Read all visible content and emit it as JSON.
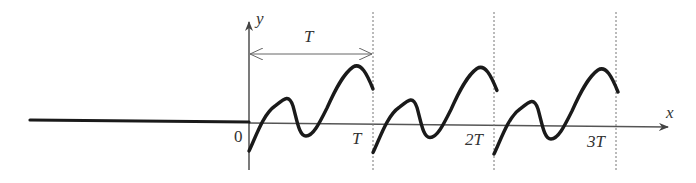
{
  "diagram": {
    "colors": {
      "curve": "#1a1a1a",
      "axis": "#555555",
      "dashed": "#777777",
      "text": "#333333"
    },
    "axes": {
      "x_label": "x",
      "y_label": "y",
      "origin_label": "0"
    },
    "period_annotation": {
      "label": "T"
    },
    "tick_labels": [
      "T",
      "2T",
      "3T"
    ],
    "periods_shown": 3
  }
}
